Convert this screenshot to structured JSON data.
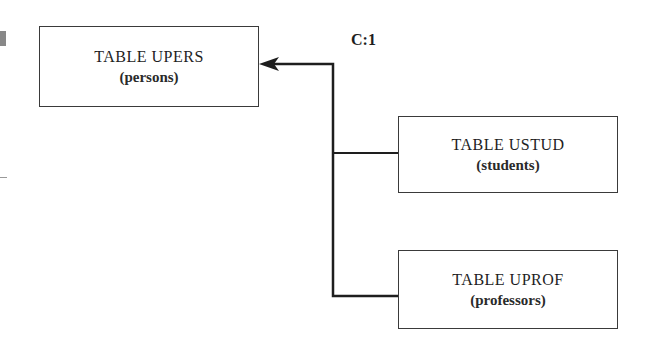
{
  "diagram": {
    "type": "table-inheritance",
    "nodes": [
      {
        "id": "upers",
        "title": "TABLE UPERS",
        "subtitle": "(persons)"
      },
      {
        "id": "ustud",
        "title": "TABLE USTUD",
        "subtitle": "(students)"
      },
      {
        "id": "uprof",
        "title": "TABLE UPROF",
        "subtitle": "(professors)"
      }
    ],
    "edges": [
      {
        "from": "ustud",
        "to": "upers"
      },
      {
        "from": "uprof",
        "to": "upers"
      }
    ],
    "cardinality_label": "C:1",
    "colors": {
      "line": "#1e1e1e",
      "border": "#3a3a3a",
      "background": "#ffffff"
    }
  }
}
